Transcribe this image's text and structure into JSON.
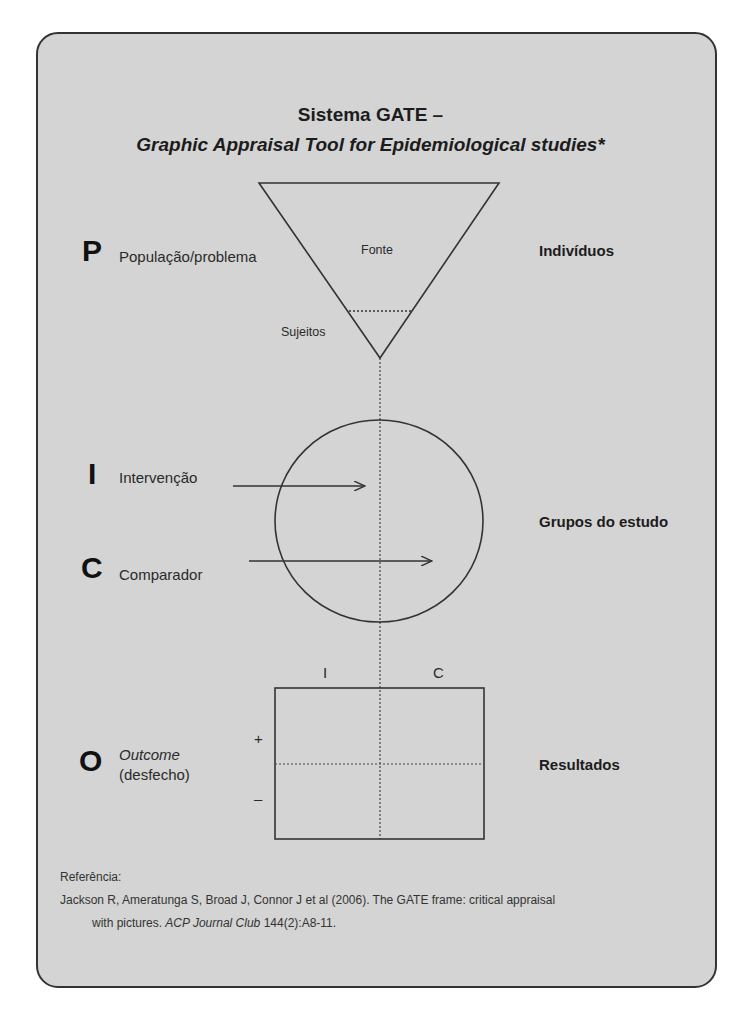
{
  "title": {
    "line1": "Sistema GATE –",
    "line2": "Graphic Appraisal Tool for Epidemiological studies*"
  },
  "rows": {
    "p": {
      "letter": "P",
      "label": "População/problema",
      "right": "Indivíduos"
    },
    "i": {
      "letter": "I",
      "label": "Intervenção"
    },
    "c": {
      "letter": "C",
      "label": "Comparador"
    },
    "groups_right": "Grupos do estudo",
    "o": {
      "letter": "O",
      "label_italic": "Outcome",
      "label2": "(desfecho)",
      "right": "Resultados"
    }
  },
  "triangle": {
    "upper_label": "Fonte",
    "lower_label": "Sujeitos"
  },
  "outcome_table": {
    "col_i": "I",
    "col_c": "C",
    "row_plus": "+",
    "row_minus": "–"
  },
  "reference": {
    "heading": "Referência:",
    "line1": "Jackson R, Ameratunga S, Broad J, Connor J et al (2006). The GATE frame: critical appraisal",
    "line2_pre": "with pictures. ",
    "journal": "ACP Journal Club",
    "line2_post": " 144(2):A8-11."
  },
  "colors": {
    "panel": "#d4d4d4",
    "stroke": "#333333"
  }
}
